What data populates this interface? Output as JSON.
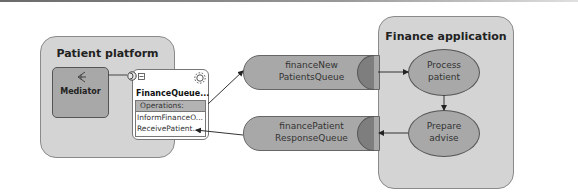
{
  "containers": {
    "patient_platform": {
      "title": "Patient platform"
    },
    "finance_application": {
      "title": "Finance application"
    }
  },
  "mediator": {
    "label": "Mediator",
    "icon": "mediator-icon"
  },
  "component": {
    "title": "FinanceQueue...",
    "operations_header": "Operations:",
    "operations": [
      "InformFinanceO...",
      "ReceivePatient..."
    ],
    "icons": [
      "interface-port-icon",
      "collapse-icon",
      "gear-icon"
    ]
  },
  "queues": [
    {
      "line1": "financeNew",
      "line2": "PatientsQueue"
    },
    {
      "line1": "financePatient",
      "line2": "ResponseQueue"
    }
  ],
  "activities": [
    {
      "line1": "Process",
      "line2": "patient"
    },
    {
      "line1": "Prepare",
      "line2": "advise"
    }
  ],
  "colors": {
    "container": "#d4d4d4",
    "node": "#a8a8a8",
    "queue_cap": "#7e7e7e"
  }
}
